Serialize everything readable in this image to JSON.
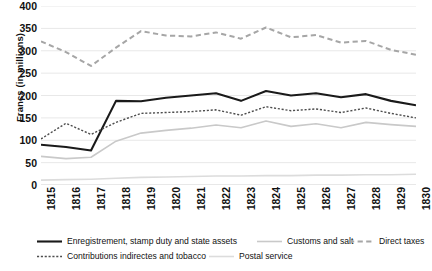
{
  "chart_data": {
    "type": "line",
    "title": "",
    "xlabel": "",
    "ylabel": "Francs (in millions)",
    "ylim": [
      0,
      400
    ],
    "ytick_step": 50,
    "yticks": [
      "400",
      "350",
      "300",
      "250",
      "200",
      "150",
      "100",
      "50",
      "0"
    ],
    "grid": "horizontal",
    "legend_position": "bottom",
    "categories": [
      "1815",
      "1816",
      "1817",
      "1818",
      "1819",
      "1820",
      "1821",
      "1822",
      "1823",
      "1824",
      "1825",
      "1826",
      "1827",
      "1828",
      "1829",
      "1830"
    ],
    "series": [
      {
        "name": "Enregistrement, stamp duty and state assets",
        "style": "solid",
        "color": "#1a1a1a",
        "width": 2.1,
        "values": [
          90,
          85,
          77,
          188,
          187,
          195,
          200,
          205,
          188,
          210,
          200,
          205,
          196,
          203,
          188,
          178
        ]
      },
      {
        "name": "Contributions indirectes and tobacco",
        "style": "dotted",
        "color": "#4d4d4d",
        "width": 1.4,
        "values": [
          103,
          138,
          113,
          140,
          160,
          162,
          164,
          168,
          156,
          175,
          166,
          170,
          162,
          172,
          160,
          150
        ]
      },
      {
        "name": "Customs and salt",
        "style": "solid",
        "color": "#c9c9c9",
        "width": 1.6,
        "values": [
          64,
          59,
          62,
          98,
          116,
          122,
          127,
          134,
          128,
          143,
          131,
          137,
          128,
          140,
          135,
          131
        ]
      },
      {
        "name": "Direct taxes",
        "style": "dashed",
        "color": "#a6a6a6",
        "width": 2.0,
        "values": [
          321,
          297,
          266,
          307,
          344,
          334,
          332,
          341,
          327,
          352,
          330,
          335,
          318,
          322,
          302,
          291
        ]
      },
      {
        "name": "Postal service",
        "style": "solid",
        "color": "#dcdcdc",
        "width": 1.6,
        "values": [
          11,
          12,
          13,
          15,
          17,
          18,
          19,
          20,
          20,
          21,
          21,
          22,
          22,
          23,
          23,
          24
        ]
      }
    ],
    "legend": [
      {
        "label": "Enregistrement, stamp duty and state assets",
        "style": "solid",
        "color": "#1a1a1a",
        "width": 2.1
      },
      {
        "label": "Customs and salt",
        "style": "solid",
        "color": "#c9c9c9",
        "width": 1.6
      },
      {
        "label": "Direct taxes",
        "style": "dashed",
        "color": "#a6a6a6",
        "width": 2.0
      },
      {
        "label": "Contributions indirectes and tobacco",
        "style": "dotted",
        "color": "#4d4d4d",
        "width": 1.4
      },
      {
        "label": "Postal service",
        "style": "solid",
        "color": "#dcdcdc",
        "width": 1.6
      }
    ],
    "gridline_color": "#e8e8e8",
    "axis_color": "#d0d0d0"
  }
}
